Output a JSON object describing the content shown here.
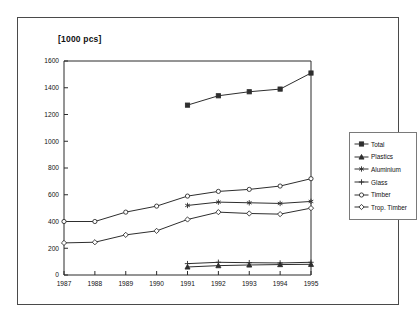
{
  "chart_data": {
    "type": "line",
    "title": "[1000 pcs]",
    "xlabel": "",
    "ylabel": "",
    "categories": [
      1987,
      1988,
      1989,
      1990,
      1991,
      1992,
      1993,
      1994,
      1995
    ],
    "xlim": [
      1987,
      1995
    ],
    "ylim": [
      0,
      1600
    ],
    "ytick_values": [
      0,
      200,
      400,
      600,
      800,
      1000,
      1200,
      1400,
      1600
    ],
    "xtick_labels": [
      "1987",
      "1988",
      "1989",
      "1990",
      "1991",
      "1992",
      "1993",
      "1994",
      "1995"
    ],
    "ytick_labels": [
      "0",
      "200",
      "400",
      "600",
      "800",
      "1000",
      "1200",
      "1400",
      "1600"
    ],
    "grid": false,
    "legend_position": "right",
    "series": [
      {
        "name": "Total",
        "marker": "filled-square",
        "x": [
          1991,
          1992,
          1993,
          1994,
          1995
        ],
        "values": [
          1270,
          1340,
          1370,
          1390,
          1510
        ]
      },
      {
        "name": "Plastics",
        "marker": "filled-triangle",
        "x": [
          1991,
          1992,
          1993,
          1994,
          1995
        ],
        "values": [
          60,
          70,
          75,
          78,
          80
        ]
      },
      {
        "name": "Aluminium",
        "marker": "asterisk",
        "x": [
          1991,
          1992,
          1993,
          1994,
          1995
        ],
        "values": [
          520,
          545,
          540,
          535,
          550
        ]
      },
      {
        "name": "Glass",
        "marker": "plus",
        "x": [
          1991,
          1992,
          1993,
          1994,
          1995
        ],
        "values": [
          85,
          95,
          92,
          90,
          95
        ]
      },
      {
        "name": "Timber",
        "marker": "open-circle",
        "x": [
          1987,
          1988,
          1989,
          1990,
          1991,
          1992,
          1993,
          1994,
          1995
        ],
        "values": [
          400,
          400,
          470,
          515,
          590,
          625,
          640,
          665,
          720
        ]
      },
      {
        "name": "Trop. Timber",
        "marker": "open-diamond",
        "x": [
          1987,
          1988,
          1989,
          1990,
          1991,
          1992,
          1993,
          1994,
          1995
        ],
        "values": [
          240,
          245,
          300,
          330,
          415,
          470,
          460,
          455,
          500
        ]
      }
    ]
  }
}
